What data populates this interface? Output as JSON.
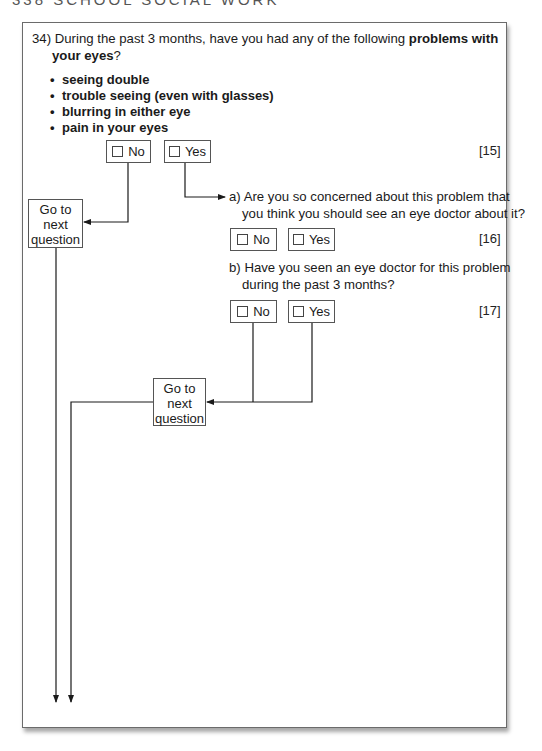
{
  "page_header": "338  SCHOOL SOCIAL WORK",
  "question": {
    "number": "34)",
    "text_part1": "During the past 3 months, have you had any of the following ",
    "text_bold": "problems with",
    "text_line2_bold": "your eyes",
    "text_line2_end": "?",
    "bullets": [
      "seeing double",
      "trouble seeing (even with glasses)",
      "blurring in either eye",
      "pain in your eyes"
    ],
    "options": {
      "no": "No",
      "yes": "Yes"
    },
    "ref": "[15]"
  },
  "goto_label": [
    "Go to",
    "next",
    "question"
  ],
  "sub_a": {
    "line1": "a) Are you so concerned about this problem that",
    "line2": "you think you should see an eye doctor about it?",
    "options": {
      "no": "No",
      "yes": "Yes"
    },
    "ref": "[16]"
  },
  "sub_b": {
    "line1": "b) Have you seen an eye doctor for this problem",
    "line2": "during the past 3 months?",
    "options": {
      "no": "No",
      "yes": "Yes"
    },
    "ref": "[17]"
  },
  "colors": {
    "line": "#1a1a1a",
    "border": "#555555"
  }
}
